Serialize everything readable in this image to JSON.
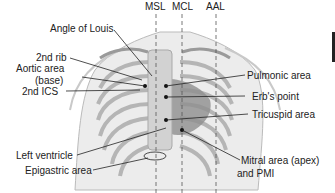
{
  "diagram": {
    "type": "anatomical-landmarks",
    "lines": {
      "msl": "MSL",
      "mcl": "MCL",
      "aal": "AAL"
    },
    "labels_left": {
      "angle_of_louis": "Angle of Louis",
      "second_rib": "2nd rib",
      "aortic_area_1": "Aortic area",
      "aortic_area_2": "(base)",
      "second_ics": "2nd ICS",
      "left_ventricle": "Left ventricle",
      "epigastric_area": "Epigastric area"
    },
    "labels_right": {
      "pulmonic_area": "Pulmonic area",
      "erbs_point": "Erb's point",
      "tricuspid_area": "Tricuspid area",
      "mitral_area_1": "Mitral area (apex)",
      "mitral_area_2": "and PMI"
    },
    "colors": {
      "text": "#222222",
      "skin": "#e4e4e4",
      "ribs": "#bdbdbd",
      "heart": "#8a8a8a",
      "sternum": "#d0d0d0",
      "leader": "#222222"
    }
  }
}
